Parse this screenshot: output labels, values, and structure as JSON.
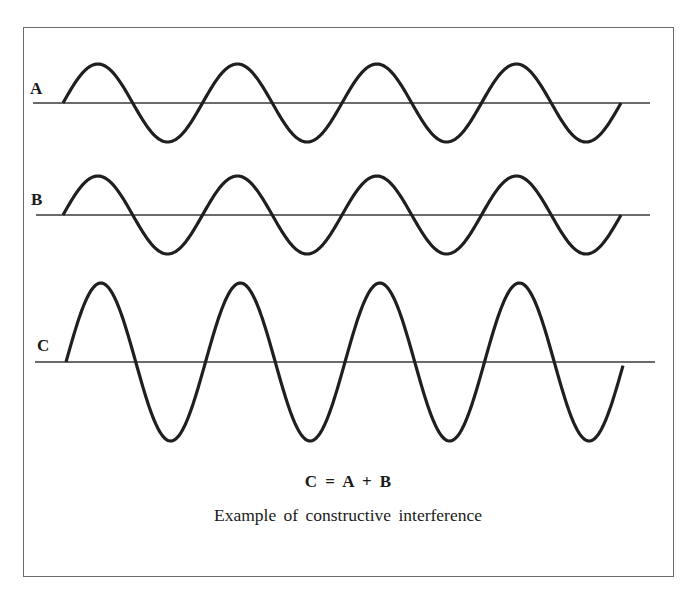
{
  "diagram": {
    "frame": {
      "x": 23,
      "y": 27,
      "width": 651,
      "height": 550,
      "border_color": "#6a6a6a"
    },
    "line_color": "#1f1f1f",
    "axis_color": "#3a3a3a",
    "waves": [
      {
        "id": "A",
        "label": "A",
        "label_x": 30,
        "label_y": 80,
        "baseline_y": 103,
        "amplitude": 39,
        "x_start": 63,
        "x_end": 621,
        "period": 139.5,
        "axis_x_start": 33,
        "axis_x_end": 650
      },
      {
        "id": "B",
        "label": "B",
        "label_x": 31,
        "label_y": 191,
        "baseline_y": 215,
        "amplitude": 39,
        "x_start": 63,
        "x_end": 621,
        "period": 139.5,
        "axis_x_start": 36,
        "axis_x_end": 650
      },
      {
        "id": "C",
        "label": "C",
        "label_x": 37,
        "label_y": 337,
        "baseline_y": 362,
        "amplitude": 79,
        "x_start": 66,
        "x_end": 623,
        "period": 139.5,
        "axis_x_start": 35,
        "axis_x_end": 655
      }
    ],
    "equation": "C = A + B",
    "caption": "Example of constructive interference"
  }
}
